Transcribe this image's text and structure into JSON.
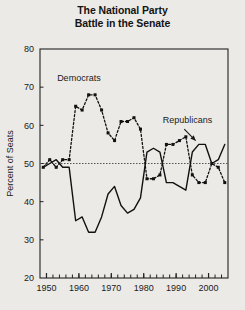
{
  "title": {
    "line1": "The National Party",
    "line2": "Battle in the Senate"
  },
  "axes": {
    "ylabel": "Percent of Seats",
    "ylim": [
      20,
      80
    ],
    "yticks": [
      20,
      30,
      40,
      50,
      60,
      70,
      80
    ],
    "ytick_labels": [
      "20",
      "30",
      "40",
      "50",
      "60",
      "70",
      "80"
    ],
    "xlim": [
      1948,
      2006
    ],
    "xticks": [
      1950,
      1960,
      1970,
      1980,
      1990,
      2000
    ],
    "xtick_labels": [
      "1950",
      "1960",
      "1970",
      "1980",
      "1990",
      "2000"
    ],
    "xminor_step": 2,
    "reference_line": 50,
    "grid": false
  },
  "annotations": [
    {
      "name": "democrats-label",
      "text": "Democrats",
      "x": 1960,
      "y": 71.5
    },
    {
      "name": "republicans-label",
      "text": "Republicans",
      "x": 1993.5,
      "y": 60.5
    }
  ],
  "arrow": {
    "from_x": 1992.5,
    "from_y": 59.0,
    "to_x": 1996.0,
    "to_y": 56.0
  },
  "colors": {
    "background": "#eceae6",
    "axis": "#222222",
    "democrats": "#111111",
    "republicans": "#111111",
    "reference_line": "#555555",
    "text": "#1a1a1a"
  },
  "chart_data": {
    "type": "line",
    "title": "The National Party Battle in the Senate",
    "xlabel": "",
    "ylabel": "Percent of Seats",
    "xlim": [
      1948,
      2006
    ],
    "ylim": [
      20,
      80
    ],
    "grid": false,
    "legend_position": "inline-annotation",
    "reference_line": {
      "y": 50,
      "style": "dotted",
      "label": ""
    },
    "x": [
      1949,
      1951,
      1953,
      1955,
      1957,
      1959,
      1961,
      1963,
      1965,
      1967,
      1969,
      1971,
      1973,
      1975,
      1977,
      1979,
      1981,
      1983,
      1985,
      1987,
      1989,
      1991,
      1993,
      1995,
      1997,
      1999,
      2001,
      2003,
      2005
    ],
    "series": [
      {
        "name": "Democrats",
        "style": "dashed",
        "marker": "square",
        "values": [
          49,
          51,
          49,
          51,
          51,
          65,
          64,
          68,
          68,
          64,
          58,
          56,
          61,
          61,
          62,
          59,
          46,
          46,
          47,
          55,
          55,
          56,
          57,
          47,
          45,
          45,
          50,
          49,
          45
        ]
      },
      {
        "name": "Republicans",
        "style": "solid",
        "marker": "none",
        "values": [
          49,
          50,
          51,
          49,
          49,
          35,
          36,
          32,
          32,
          36,
          42,
          44,
          39,
          37,
          38,
          41,
          53,
          54,
          53,
          45,
          45,
          44,
          43,
          53,
          55,
          55,
          50,
          51,
          55
        ]
      }
    ]
  }
}
